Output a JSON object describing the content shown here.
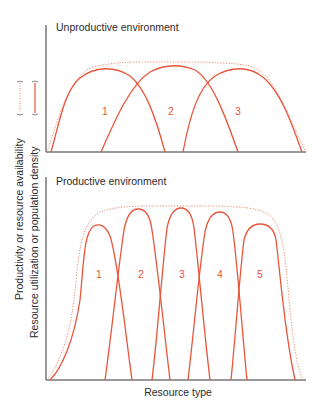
{
  "figure": {
    "top_panel": {
      "title": "Unproductive environment",
      "curve_labels": [
        "1",
        "2",
        "3"
      ]
    },
    "bottom_panel": {
      "title": "Productive environment",
      "curve_labels": [
        "1",
        "2",
        "3",
        "4",
        "5"
      ]
    },
    "xlabel": "Resource type",
    "ylabel_dotted": "Productivity or resource availability",
    "ylabel_solid": "Resource utilization or population density",
    "legend_dotted_icon": "dotted-line-bracket",
    "legend_solid_icon": "solid-line-bracket"
  },
  "colors": {
    "curve": "#e8553a",
    "envelope": "#ec8a6e",
    "axis": "#333333",
    "text": "#2a2a2a"
  }
}
